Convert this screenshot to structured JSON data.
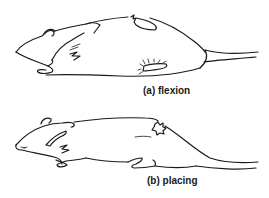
{
  "figure": {
    "panels": [
      {
        "id": "a",
        "label": "(a) flexion",
        "subject": "rat lying on side with hindlimb flexed"
      },
      {
        "id": "b",
        "label": "(b) placing",
        "subject": "rat lying prone with limbs placed"
      }
    ],
    "colors": {
      "line": "#1a1a1a",
      "background": "#ffffff"
    }
  }
}
